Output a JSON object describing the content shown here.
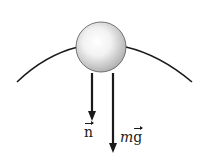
{
  "diagram": {
    "colors": {
      "ink": "#1a1a1a",
      "ball_light": "#ffffff",
      "ball_dark": "#b8b8b8",
      "background": "#ffffff"
    },
    "ball": {
      "cx": 101,
      "cy": 47,
      "r": 25
    },
    "surface": {
      "left_start": [
        17,
        82
      ],
      "right_end": [
        192,
        82
      ]
    },
    "forces": [
      {
        "id": "normal",
        "symbol": "n",
        "x": 92,
        "y_start": 73,
        "y_end": 120,
        "label_x": 84,
        "label_y": 129
      },
      {
        "id": "weight",
        "prefix": "m",
        "symbol": "g",
        "x": 113,
        "y_start": 73,
        "y_end": 152,
        "label_x": 120,
        "label_y": 134
      }
    ]
  }
}
